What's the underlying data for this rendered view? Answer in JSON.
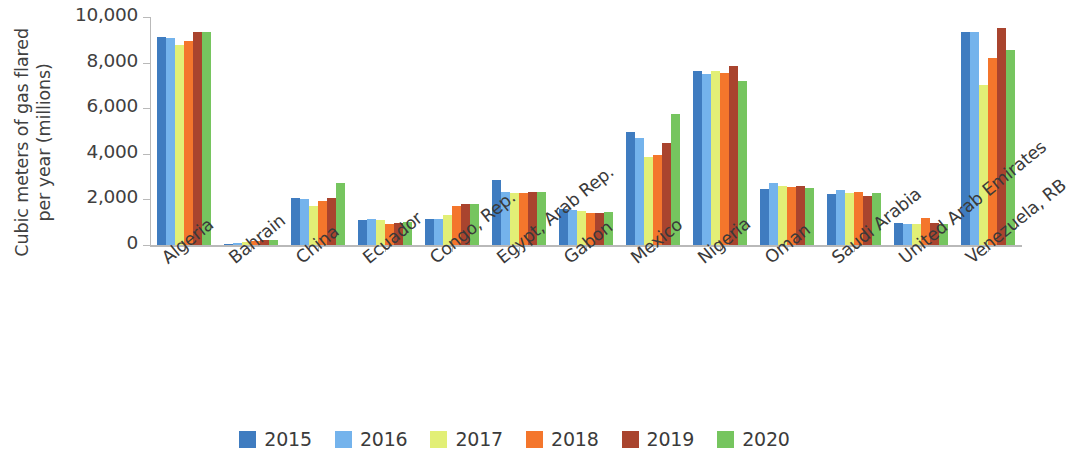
{
  "chart_data": {
    "type": "bar",
    "title": "",
    "xlabel": "",
    "ylabel": "Cubic meters of gas flared per year (millions)",
    "ylim": [
      0,
      10000
    ],
    "ytick_labels": [
      "10,000",
      "8,000",
      "6,000",
      "4,000",
      "2,000",
      "0"
    ],
    "ytick_values": [
      10000,
      8000,
      6000,
      4000,
      2000,
      0
    ],
    "grid": false,
    "legend_position": "bottom",
    "categories": [
      "Algeria",
      "Bahrain",
      "China",
      "Ecuador",
      "Congo, Rep.",
      "Egypt, Arab Rep.",
      "Gabon",
      "Mexico",
      "Nigeria",
      "Oman",
      "Saudi Arabia",
      "United Arab Emirates",
      "Venezuela, RB"
    ],
    "series": [
      {
        "name": "2015",
        "color": "#3f7cc0",
        "values": [
          9120,
          60,
          2080,
          1080,
          1150,
          2840,
          1560,
          4940,
          7640,
          2440,
          2220,
          960,
          9340
        ]
      },
      {
        "name": "2016",
        "color": "#74b3ec",
        "values": [
          9080,
          90,
          2030,
          1130,
          1150,
          2320,
          1550,
          4700,
          7500,
          2700,
          2400,
          900,
          9350
        ]
      },
      {
        "name": "2017",
        "color": "#e2ef76",
        "values": [
          8760,
          130,
          1700,
          1080,
          1330,
          2280,
          1480,
          3840,
          7650,
          2600,
          2300,
          900,
          7000
        ]
      },
      {
        "name": "2018",
        "color": "#f4762c",
        "values": [
          8960,
          175,
          1950,
          940,
          1700,
          2260,
          1420,
          3930,
          7540,
          2540,
          2310,
          1170,
          8200
        ]
      },
      {
        "name": "2019",
        "color": "#a9442e",
        "values": [
          9330,
          215,
          2060,
          950,
          1790,
          2310,
          1420,
          4480,
          7860,
          2580,
          2140,
          980,
          9500
        ]
      },
      {
        "name": "2020",
        "color": "#76c55f",
        "values": [
          9340,
          215,
          2700,
          990,
          1820,
          2340,
          1450,
          5760,
          7200,
          2520,
          2280,
          930,
          8550
        ]
      }
    ]
  }
}
